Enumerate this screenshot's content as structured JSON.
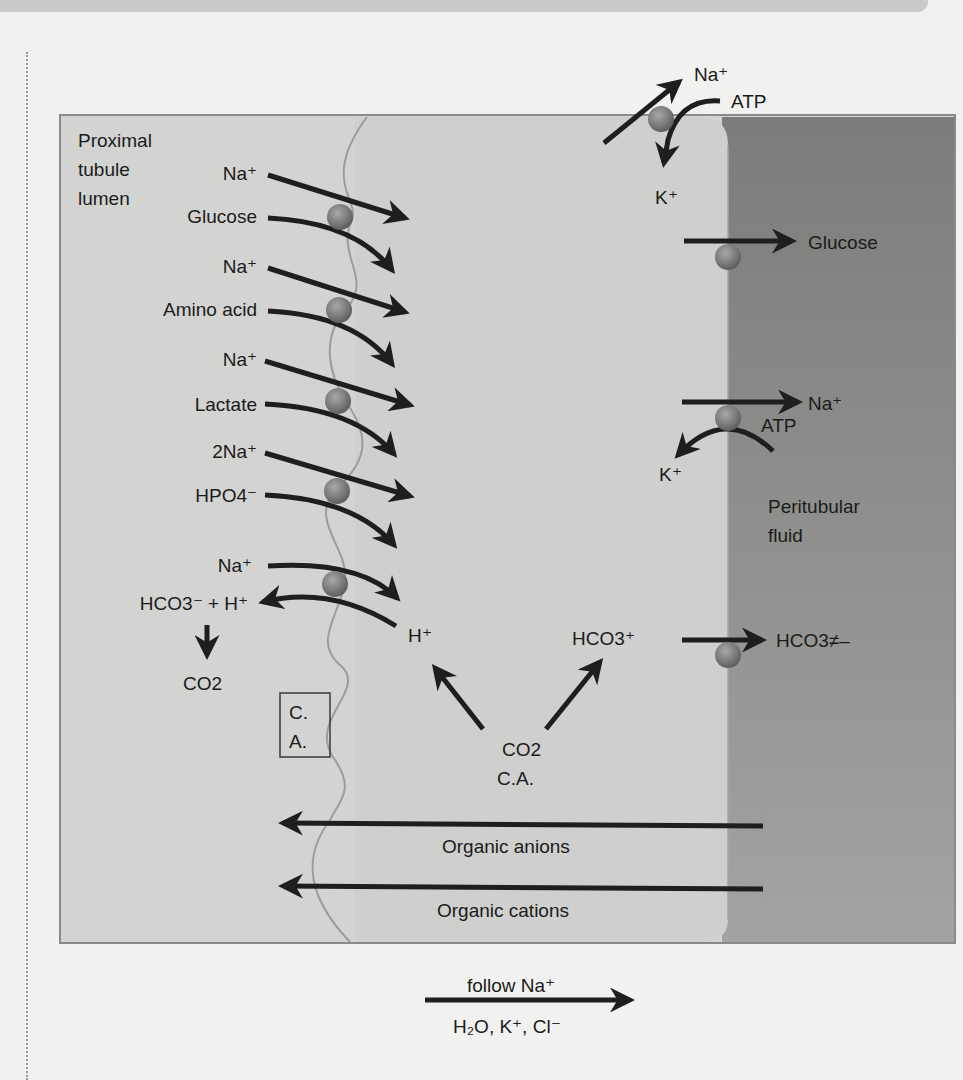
{
  "regions": {
    "lumen": "Proximal tubule lumen",
    "lumen_lines": [
      "Proximal",
      "tubule",
      "lumen"
    ],
    "peritubular_lines": [
      "Peritubular",
      "fluid"
    ]
  },
  "cotransporters": [
    {
      "ion": "Na⁺",
      "substrate": "Glucose"
    },
    {
      "ion": "Na⁺",
      "substrate": "Amino acid"
    },
    {
      "ion": "Na⁺",
      "substrate": "Lactate"
    },
    {
      "ion": "2Na⁺",
      "substrate": "HPO4⁻"
    }
  ],
  "exchanger": {
    "ion_in": "Na⁺",
    "ion_out": "HCO3⁻ + H⁺",
    "product": "CO2",
    "cell_h": "H⁺"
  },
  "carbonic_anhydrase": {
    "box_line1": "C.",
    "box_line2": "A.",
    "cell_co2": "CO2",
    "cell_ca": "C.A.",
    "cell_hco3": "HCO3⁺",
    "basolateral_hco3": "HCO3≠–"
  },
  "pump_top": {
    "na": "Na⁺",
    "atp": "ATP",
    "k": "K⁺"
  },
  "pump_mid": {
    "na": "Na⁺",
    "atp": "ATP",
    "k": "K⁺"
  },
  "basolateral_glucose": "Glucose",
  "secretion": [
    {
      "label": "Organic anions"
    },
    {
      "label": "Organic cations"
    }
  ],
  "paracellular": {
    "above": "follow Na⁺",
    "below": "H₂O, K⁺, Cl⁻"
  },
  "colors": {
    "lumen_bg": "#d5d5d3",
    "cell_bg": "#cdcdcb",
    "peritubular_bg": "#8e8e8c",
    "carrier": "#7f7f7f",
    "arrow": "#1e1e1e"
  }
}
